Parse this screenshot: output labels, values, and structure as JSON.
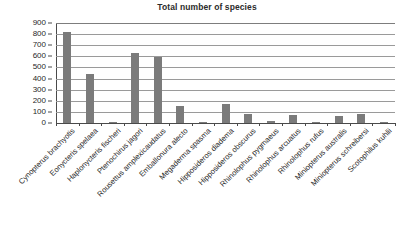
{
  "chart_data": {
    "type": "bar",
    "title": "Total number of species",
    "xlabel": "",
    "ylabel": "",
    "ylim": [
      0,
      900
    ],
    "ytick_step": 100,
    "yticks": [
      0,
      100,
      200,
      300,
      400,
      500,
      600,
      700,
      800,
      900
    ],
    "grid": true,
    "legend": false,
    "bar_color": "#7b7b7b",
    "categories": [
      "Cynopterus brachyotis",
      "Eonycteris spelaea",
      "Haplonycteris fischeri",
      "Ptenochirus jagori",
      "Rousettus amplexicaudatus",
      "Emballonura alecto",
      "Megaderma spasma",
      "Hipposideros diadema",
      "Hipposideros obscurus",
      "Rhinolophus pygmaeus",
      "Rhinolophus arcuatus",
      "Rhinolophus rufus",
      "Miniopterus australis",
      "Miniopterus schreibersi",
      "Scotophilus kuhlii"
    ],
    "values": [
      820,
      440,
      5,
      630,
      590,
      150,
      5,
      175,
      85,
      20,
      70,
      5,
      60,
      80,
      8
    ]
  }
}
